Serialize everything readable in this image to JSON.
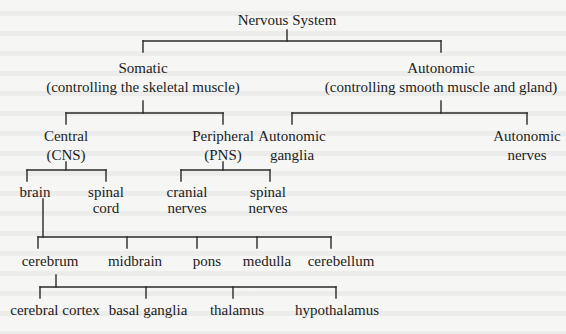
{
  "diagram": {
    "title": "Nervous System",
    "nodes": {
      "root": {
        "label": "Nervous System"
      },
      "somatic": {
        "line1": "Somatic",
        "line2": "(controlling the skeletal muscle)"
      },
      "autonomic": {
        "line1": "Autonomic",
        "line2": "(controlling smooth muscle and gland)"
      },
      "central": {
        "line1": "Central",
        "line2": "(CNS)"
      },
      "peripheral": {
        "line1": "Peripheral",
        "line2": "(PNS)"
      },
      "autonomic_ganglia": {
        "line1": "Autonomic",
        "line2": "ganglia"
      },
      "autonomic_nerves": {
        "line1": "Autonomic",
        "line2": "nerves"
      },
      "brain": {
        "label": "brain"
      },
      "spinal_cord": {
        "line1": "spinal",
        "line2": "cord"
      },
      "cranial_nerves": {
        "line1": "cranial",
        "line2": "nerves"
      },
      "spinal_nerves": {
        "line1": "spinal",
        "line2": "nerves"
      },
      "cerebrum": {
        "label": "cerebrum"
      },
      "midbrain": {
        "label": "midbrain"
      },
      "pons": {
        "label": "pons"
      },
      "medulla": {
        "label": "medulla"
      },
      "cerebellum": {
        "label": "cerebellum"
      },
      "cerebral_cortex": {
        "label": "cerebral cortex"
      },
      "basal_ganglia": {
        "label": "basal ganglia"
      },
      "thalamus": {
        "label": "thalamus"
      },
      "hypothalamus": {
        "label": "hypothalamus"
      }
    },
    "edges": [
      [
        "Nervous System",
        "Somatic"
      ],
      [
        "Nervous System",
        "Autonomic"
      ],
      [
        "Somatic",
        "Central (CNS)"
      ],
      [
        "Somatic",
        "Peripheral (PNS)"
      ],
      [
        "Autonomic",
        "Autonomic ganglia"
      ],
      [
        "Autonomic",
        "Autonomic nerves"
      ],
      [
        "Central (CNS)",
        "brain"
      ],
      [
        "Central (CNS)",
        "spinal cord"
      ],
      [
        "Peripheral (PNS)",
        "cranial nerves"
      ],
      [
        "Peripheral (PNS)",
        "spinal nerves"
      ],
      [
        "brain",
        "cerebrum"
      ],
      [
        "brain",
        "midbrain"
      ],
      [
        "brain",
        "pons"
      ],
      [
        "brain",
        "medulla"
      ],
      [
        "brain",
        "cerebellum"
      ],
      [
        "cerebrum",
        "cerebral cortex"
      ],
      [
        "cerebrum",
        "basal ganglia"
      ],
      [
        "cerebrum",
        "thalamus"
      ],
      [
        "cerebrum",
        "hypothalamus"
      ]
    ]
  }
}
